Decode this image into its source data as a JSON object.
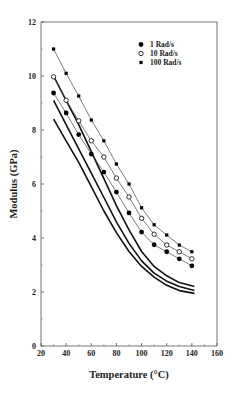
{
  "chart_data": {
    "type": "line",
    "title": "",
    "xlabel": "Temperature (°C)",
    "ylabel": "Modulus (GPa)",
    "xlim": [
      20,
      160
    ],
    "ylim": [
      0,
      12
    ],
    "xticks": [
      20,
      40,
      60,
      80,
      100,
      120,
      140,
      160
    ],
    "yticks": [
      0,
      2,
      4,
      6,
      8,
      10,
      12
    ],
    "grid": false,
    "legend_position": "upper right",
    "x": [
      30,
      40,
      50,
      60,
      70,
      80,
      90,
      100,
      110,
      120,
      130,
      140
    ],
    "series": [
      {
        "name": "1 Rad/s",
        "marker": "filled-circle",
        "values": [
          9.37,
          8.63,
          7.83,
          7.11,
          6.44,
          5.7,
          4.93,
          4.22,
          3.75,
          3.49,
          3.23,
          2.97
        ]
      },
      {
        "name": "10 Rad/s",
        "marker": "open-circle",
        "values": [
          9.97,
          9.1,
          8.34,
          7.6,
          7.0,
          6.22,
          5.52,
          4.73,
          4.14,
          3.74,
          3.49,
          3.23
        ]
      },
      {
        "name": "100 Rad/s",
        "marker": "filled-square",
        "values": [
          11.0,
          10.1,
          9.26,
          8.37,
          7.6,
          6.74,
          6.0,
          5.12,
          4.49,
          4.11,
          3.74,
          3.49
        ]
      }
    ],
    "unlabeled_curves": [
      {
        "name": "model curve 1",
        "x": [
          30,
          40,
          50,
          60,
          70,
          80,
          90,
          100,
          110,
          120,
          130,
          142
        ],
        "values": [
          10.0,
          9.1,
          8.2,
          7.2,
          6.2,
          5.2,
          4.3,
          3.5,
          2.95,
          2.6,
          2.35,
          2.2
        ]
      },
      {
        "name": "model curve 2",
        "x": [
          30,
          40,
          50,
          60,
          70,
          80,
          90,
          100,
          110,
          120,
          130,
          142
        ],
        "values": [
          9.1,
          8.2,
          7.3,
          6.4,
          5.5,
          4.6,
          3.8,
          3.15,
          2.7,
          2.4,
          2.2,
          2.05
        ]
      },
      {
        "name": "model curve 3",
        "x": [
          30,
          40,
          50,
          60,
          70,
          80,
          90,
          100,
          110,
          120,
          130,
          142
        ],
        "values": [
          8.4,
          7.6,
          6.8,
          5.9,
          5.0,
          4.2,
          3.5,
          2.95,
          2.55,
          2.25,
          2.05,
          1.95
        ]
      }
    ]
  }
}
